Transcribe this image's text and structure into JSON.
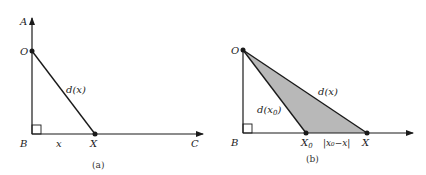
{
  "panels": {
    "a": {
      "caption": "(a)",
      "labels": {
        "A": "A",
        "O": "O",
        "B": "B",
        "X": "X",
        "C": "C",
        "x": "x",
        "d": "d(x)"
      }
    },
    "b": {
      "caption": "(b)",
      "labels": {
        "O": "O",
        "B": "B",
        "X0": "X",
        "X0_sub": "0",
        "X": "X",
        "abs_diff": "|x₀−x|",
        "d_x": "d(x)",
        "d_x0": "d(x",
        "d_x0_sub": "0",
        "d_x0_close": ")"
      },
      "fill_color": "#b8b8b8"
    }
  },
  "colors": {
    "line": "#1a1a1a",
    "shade": "#b8b8b8"
  }
}
